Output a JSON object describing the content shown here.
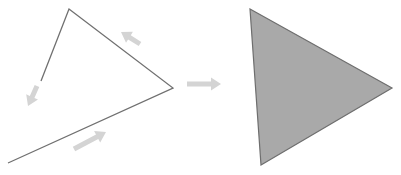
{
  "diagram": {
    "colors": {
      "background": "#ffffff",
      "path_stroke": "#707070",
      "arrow_fill": "#d4d4d4",
      "triangle_fill": "#a9a9a9",
      "triangle_stroke": "#6e6e6e"
    },
    "open_path": {
      "points": [
        [
          8,
          163
        ],
        [
          173,
          88
        ],
        [
          69,
          9
        ],
        [
          41,
          81
        ]
      ]
    },
    "direction_arrows": [
      {
        "name": "arrow-along-bottom-edge",
        "from": [
          74,
          149
        ],
        "to": [
          106,
          132
        ]
      },
      {
        "name": "arrow-along-top-right-edge",
        "from": [
          140,
          44
        ],
        "to": [
          121,
          32
        ]
      },
      {
        "name": "arrow-along-left-edge",
        "from": [
          37,
          86
        ],
        "to": [
          28,
          106
        ]
      }
    ],
    "transform_arrow": {
      "from": [
        187,
        84
      ],
      "to": [
        221,
        84
      ]
    },
    "filled_triangle": {
      "points": [
        [
          250,
          9
        ],
        [
          392,
          88
        ],
        [
          261,
          165
        ]
      ]
    }
  }
}
